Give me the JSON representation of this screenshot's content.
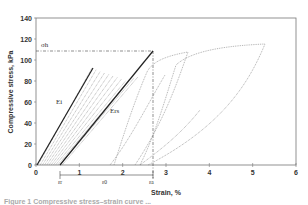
{
  "chart_data": {
    "type": "line",
    "title": "",
    "xlabel": "Strain, %",
    "ylabel": "Compressive stress, kPa",
    "xlim": [
      0,
      6
    ],
    "ylim": [
      0,
      140
    ],
    "x_ticks": [
      "0",
      "1",
      "2",
      "3",
      "4",
      "5",
      "6"
    ],
    "y_ticks": [
      "0",
      "20",
      "40",
      "60",
      "80",
      "100",
      "120",
      "140"
    ],
    "grid": false,
    "legend": null,
    "annotations": {
      "sigma_h": {
        "label": "σh",
        "stress_kPa": 108
      },
      "Ei": {
        "label": "Ei",
        "x": 0.9,
        "y": 60
      },
      "Ers": {
        "label": "Ers",
        "x": 2.0,
        "y": 45
      },
      "eps_r": {
        "label": "εr",
        "strain": 0.55
      },
      "eps_0": {
        "label": "ε0",
        "strain": 1.5
      },
      "eps_a": {
        "label": "εa",
        "strain": 2.7
      }
    },
    "series": [
      {
        "name": "Ei (initial modulus)",
        "style": "solid",
        "x": [
          0.0,
          1.3
        ],
        "y": [
          0,
          92
        ]
      },
      {
        "name": "Ers (resilient modulus)",
        "style": "solid",
        "x": [
          0.55,
          2.7
        ],
        "y": [
          0,
          108
        ]
      },
      {
        "name": "cycle loops (dense)",
        "style": "dotted",
        "x": [
          0.0,
          0.6,
          1.2,
          1.8,
          2.2
        ],
        "y": [
          0,
          40,
          78,
          100,
          104
        ]
      },
      {
        "name": "loop A loading",
        "style": "dotted",
        "x": [
          1.4,
          2.0,
          2.6,
          3.0,
          3.5
        ],
        "y": [
          0,
          40,
          85,
          105,
          110
        ]
      },
      {
        "name": "loop A unloading",
        "style": "dotted",
        "x": [
          3.5,
          2.9,
          2.3,
          1.8
        ],
        "y": [
          110,
          80,
          40,
          0
        ]
      },
      {
        "name": "loop B loading",
        "style": "dotted",
        "x": [
          2.4,
          3.2,
          3.9,
          4.4,
          5.3
        ],
        "y": [
          0,
          40,
          100,
          112,
          118
        ]
      },
      {
        "name": "loop B unloading",
        "style": "dotted",
        "x": [
          5.3,
          4.6,
          3.6,
          2.5
        ],
        "y": [
          118,
          80,
          40,
          0
        ]
      }
    ]
  },
  "figure": {
    "xlabel": "Strain, %",
    "ylabel": "Compressive stress, kPa",
    "x_ticks": [
      "0",
      "1",
      "2",
      "3",
      "4",
      "5",
      "6"
    ],
    "y_ticks": [
      "0",
      "20",
      "40",
      "60",
      "80",
      "100",
      "120",
      "140"
    ],
    "labels": {
      "sigma_h": "σh",
      "Ei": "Ei",
      "Ers": "Ers",
      "eps_r": "εr",
      "eps_0": "ε0",
      "eps_a": "εa"
    },
    "caption": "Figure 1  Compressive stress–strain curve ..."
  }
}
